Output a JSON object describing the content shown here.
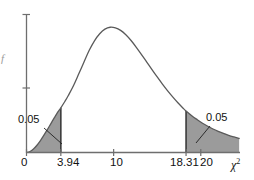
{
  "chart_data": {
    "type": "area",
    "title": "",
    "subtitle": "",
    "xlabel": "χ²",
    "ylabel": "f",
    "grid": false,
    "legend": "none",
    "xlim": [
      0,
      24.5
    ],
    "ylim": [
      0,
      1.05
    ],
    "x_ticks": [
      {
        "value": 0,
        "label": "0"
      },
      {
        "value": 3.94,
        "label": "3.94"
      },
      {
        "value": 10,
        "label": "10"
      },
      {
        "value": 18.31,
        "label": "18.31"
      },
      {
        "value": 20,
        "label": "20"
      }
    ],
    "y_ticks": [
      {
        "value": 0.52,
        "label": ""
      },
      {
        "value": 1.0,
        "label": ""
      }
    ],
    "series": [
      {
        "name": "chi-square density",
        "x": [
          0.0,
          0.4,
          0.8,
          1.2,
          1.6,
          2.0,
          2.4,
          2.8,
          3.2,
          3.6,
          3.94,
          4.4,
          4.8,
          5.4,
          6.0,
          6.6,
          7.2,
          7.8,
          8.4,
          9.0,
          9.6,
          10.2,
          10.8,
          11.4,
          12.0,
          12.6,
          13.2,
          13.8,
          14.4,
          15.0,
          15.6,
          16.2,
          16.8,
          17.4,
          18.0,
          18.31,
          19.0,
          19.6,
          20.2,
          20.8,
          21.4,
          22.0,
          22.6,
          23.2,
          23.8,
          24.4
        ],
        "y": [
          0.0,
          0.008,
          0.028,
          0.058,
          0.095,
          0.138,
          0.184,
          0.231,
          0.278,
          0.324,
          0.357,
          0.407,
          0.455,
          0.535,
          0.628,
          0.723,
          0.816,
          0.892,
          0.948,
          0.985,
          1.0,
          0.995,
          0.975,
          0.94,
          0.894,
          0.84,
          0.782,
          0.722,
          0.662,
          0.603,
          0.546,
          0.492,
          0.442,
          0.395,
          0.352,
          0.332,
          0.292,
          0.262,
          0.234,
          0.21,
          0.188,
          0.169,
          0.152,
          0.137,
          0.124,
          0.112
        ]
      }
    ],
    "shaded_regions": [
      {
        "name": "left-tail",
        "from": 0.0,
        "to": 3.94,
        "area": 0.05,
        "label": "0.05",
        "color": "#9b9b9b"
      },
      {
        "name": "right-tail",
        "from": 18.31,
        "to": 24.4,
        "area": 0.05,
        "label": "0.05",
        "color": "#9b9b9b"
      }
    ],
    "annotations": [
      {
        "name": "left-area-annotation",
        "text": "0.05"
      },
      {
        "name": "right-area-annotation",
        "text": "0.05"
      }
    ],
    "colors": {
      "curve": "#5a5a5a",
      "axis": "#6e6e6e",
      "fill": "#9b9b9b",
      "fill_stroke": "#3d3d3d",
      "text": "#111111",
      "background": "#ffffff"
    }
  },
  "labels": {
    "x_tick_0": "0",
    "x_tick_394": "3.94",
    "x_tick_10": "10",
    "x_tick_1831": "18.31",
    "x_tick_20": "20",
    "x_axis_title": "χ",
    "x_axis_title_sup": "2",
    "y_axis_title": "f",
    "left_area": "0.05",
    "right_area": "0.05"
  }
}
